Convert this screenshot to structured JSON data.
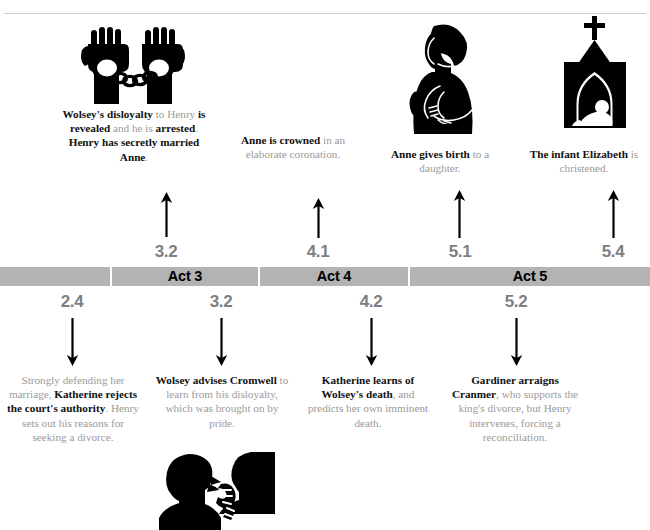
{
  "figure": {
    "type": "timeline-infographic",
    "title_rule": "divider"
  },
  "band": {
    "segments": [
      {
        "label": "",
        "x": 0,
        "width": 110
      },
      {
        "label": "Act 3",
        "x": 112,
        "width": 146
      },
      {
        "label": "Act 4",
        "x": 260,
        "width": 148
      },
      {
        "label": "Act 5",
        "x": 410,
        "width": 240
      }
    ]
  },
  "above": {
    "events": [
      {
        "scene": "3.2",
        "icon": "handcuffed-fists-icon",
        "arrow": "arrow-up-icon",
        "caption_html": "<b>Wolsey's disloyalty</b> to Henry <b>is revealed</b> and he is <b>arrested</b>. <b>Henry has secretly married Anne</b>.",
        "caption_plain": "Wolsey's disloyalty to Henry is revealed and he is arrested. Henry has secretly married Anne."
      },
      {
        "scene": "4.1",
        "icon": "",
        "arrow": "arrow-up-icon",
        "caption_html": "<b>Anne is crowned</b> in an elaborate coronation.",
        "caption_plain": "Anne is crowned in an elaborate coronation."
      },
      {
        "scene": "5.1",
        "icon": "mother-and-baby-icon",
        "arrow": "arrow-up-icon",
        "caption_html": "<b>Anne gives birth</b> to a daughter.",
        "caption_plain": "Anne gives birth to a daughter."
      },
      {
        "scene": "5.4",
        "icon": "church-christening-icon",
        "arrow": "arrow-up-icon",
        "caption_html": "<b>The infant Elizabeth</b> is christened.",
        "caption_plain": "The infant Elizabeth is christened."
      }
    ]
  },
  "below": {
    "events": [
      {
        "scene": "2.4",
        "icon": "",
        "arrow": "arrow-down-icon",
        "caption_html": "Strongly defending her marriage, <b>Katherine rejects the court's authority</b>. Henry sets out his reasons for seeking a divorce.",
        "caption_plain": "Strongly defending her marriage, Katherine rejects the court's authority. Henry sets out his reasons for seeking a divorce."
      },
      {
        "scene": "3.2",
        "icon": "two-figures-talking-icon",
        "arrow": "arrow-down-icon",
        "caption_html": "<b>Wolsey advises Cromwell</b> to learn from his disloyalty, which was brought on by pride.",
        "caption_plain": "Wolsey advises Cromwell to learn from his disloyalty, which was brought on by pride."
      },
      {
        "scene": "4.2",
        "icon": "",
        "arrow": "arrow-down-icon",
        "caption_html": "<b>Katherine learns of Wolsey's death</b>, and predicts her own imminent death.",
        "caption_plain": "Katherine learns of Wolsey's death, and predicts her own imminent death."
      },
      {
        "scene": "5.2",
        "icon": "",
        "arrow": "arrow-down-icon",
        "caption_html": "<b>Gardiner arraigns Cranmer</b>, who supports the king's divorce, but Henry intervenes, forcing a reconciliation.",
        "caption_plain": "Gardiner arraigns Cranmer, who supports the king's divorce, but Henry intervenes, forcing a reconciliation."
      }
    ]
  },
  "colors": {
    "band": "#b3b3b3",
    "scene_number": "#7d7f83",
    "body_text": "#9a9a9a",
    "emphasis_text": "#111111",
    "icon": "#000000",
    "rule": "#c9ccd0"
  }
}
